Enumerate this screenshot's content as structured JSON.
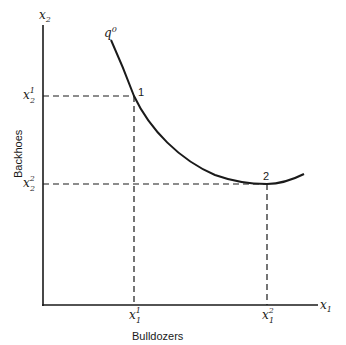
{
  "diagram": {
    "type": "isoquant",
    "axes": {
      "x": {
        "symbol": "x",
        "subscript": "1",
        "label": "Bulldozers"
      },
      "y": {
        "symbol": "x",
        "subscript": "2",
        "label": "Backhoes"
      }
    },
    "curve": {
      "label": "q",
      "superscript": "0"
    },
    "points": [
      {
        "id": "1",
        "x_tick": {
          "base": "x",
          "sub": "1",
          "sup": "1"
        },
        "y_tick": {
          "base": "x",
          "sub": "2",
          "sup": "1"
        }
      },
      {
        "id": "2",
        "x_tick": {
          "base": "x",
          "sub": "1",
          "sup": "2"
        },
        "y_tick": {
          "base": "x",
          "sub": "2",
          "sup": "2"
        }
      }
    ],
    "colors": {
      "line": "#1a1a1a",
      "background": "#ffffff"
    }
  }
}
